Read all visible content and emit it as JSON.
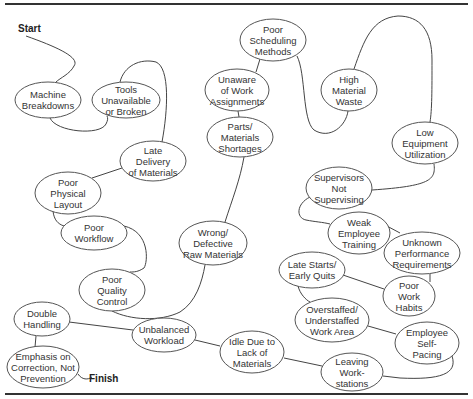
{
  "diagram": {
    "type": "spaghetti-flow",
    "start_label": "Start",
    "finish_label": "Finish",
    "colors": {
      "line": "#444444",
      "ellipse_stroke": "#555555",
      "text": "#333333",
      "rule": "#333333"
    },
    "nodes": [
      {
        "id": "machine-breakdowns",
        "lines": [
          "Machine",
          "Breakdowns"
        ],
        "cx": 48,
        "cy": 100,
        "rx": 33,
        "ry": 18
      },
      {
        "id": "tools-unavailable",
        "lines": [
          "Tools",
          "Unavailable",
          "or Broken"
        ],
        "cx": 126,
        "cy": 100,
        "rx": 34,
        "ry": 18
      },
      {
        "id": "late-delivery",
        "lines": [
          "Late",
          "Delivery",
          "of Materials"
        ],
        "cx": 153,
        "cy": 161,
        "rx": 33,
        "ry": 20
      },
      {
        "id": "poor-physical-layout",
        "lines": [
          "Poor",
          "Physical",
          "Layout"
        ],
        "cx": 68,
        "cy": 193,
        "rx": 33,
        "ry": 21
      },
      {
        "id": "poor-workflow",
        "lines": [
          "Poor",
          "Workflow"
        ],
        "cx": 94,
        "cy": 233,
        "rx": 33,
        "ry": 17
      },
      {
        "id": "poor-quality-control",
        "lines": [
          "Poor",
          "Quality",
          "Control"
        ],
        "cx": 112,
        "cy": 290,
        "rx": 33,
        "ry": 21
      },
      {
        "id": "wrong-defective-raw-materials",
        "lines": [
          "Wrong/",
          "Defective",
          "Raw Materials"
        ],
        "cx": 213,
        "cy": 243,
        "rx": 34,
        "ry": 22
      },
      {
        "id": "parts-materials-shortages",
        "lines": [
          "Parts/",
          "Materials",
          "Shortages"
        ],
        "cx": 240,
        "cy": 137,
        "rx": 33,
        "ry": 20
      },
      {
        "id": "unaware-of-work-assignments",
        "lines": [
          "Unaware",
          "of Work",
          "Assignments"
        ],
        "cx": 237,
        "cy": 90,
        "rx": 32,
        "ry": 21
      },
      {
        "id": "poor-scheduling-methods",
        "lines": [
          "Poor",
          "Scheduling",
          "Methods"
        ],
        "cx": 273,
        "cy": 40,
        "rx": 33,
        "ry": 21
      },
      {
        "id": "high-material-waste",
        "lines": [
          "High",
          "Material",
          "Waste"
        ],
        "cx": 349,
        "cy": 90,
        "rx": 28,
        "ry": 21
      },
      {
        "id": "low-equipment-utilization",
        "lines": [
          "Low",
          "Equipment",
          "Utilization"
        ],
        "cx": 425,
        "cy": 143,
        "rx": 33,
        "ry": 21
      },
      {
        "id": "supervisors-not-supervising",
        "lines": [
          "Supervisors",
          "Not",
          "Supervising"
        ],
        "cx": 339,
        "cy": 188,
        "rx": 33,
        "ry": 21
      },
      {
        "id": "weak-employee-training",
        "lines": [
          "Weak",
          "Employee",
          "Training"
        ],
        "cx": 359,
        "cy": 233,
        "rx": 31,
        "ry": 21
      },
      {
        "id": "unknown-performance-requirements",
        "lines": [
          "Unknown",
          "Performance",
          "Requirements"
        ],
        "cx": 422,
        "cy": 253,
        "rx": 38,
        "ry": 21
      },
      {
        "id": "late-starts-early-quits",
        "lines": [
          "Late Starts/",
          "Early Quits"
        ],
        "cx": 312,
        "cy": 270,
        "rx": 33,
        "ry": 18
      },
      {
        "id": "poor-work-habits",
        "lines": [
          "Poor",
          "Work",
          "Habits"
        ],
        "cx": 409,
        "cy": 296,
        "rx": 26,
        "ry": 20
      },
      {
        "id": "overstaffed-understaffed",
        "lines": [
          "Overstaffed/",
          "Understaffed",
          "Work Area"
        ],
        "cx": 332,
        "cy": 320,
        "rx": 37,
        "ry": 22
      },
      {
        "id": "employee-self-pacing",
        "lines": [
          "Employee",
          "Self-",
          "Pacing"
        ],
        "cx": 427,
        "cy": 343,
        "rx": 32,
        "ry": 21
      },
      {
        "id": "leaving-workstations",
        "lines": [
          "Leaving",
          "Work-",
          "stations"
        ],
        "cx": 352,
        "cy": 372,
        "rx": 31,
        "ry": 19
      },
      {
        "id": "idle-due-to-lack-of-materials",
        "lines": [
          "Idle Due to",
          "Lack of",
          "Materials"
        ],
        "cx": 252,
        "cy": 352,
        "rx": 32,
        "ry": 21
      },
      {
        "id": "unbalanced-workload",
        "lines": [
          "Unbalanced",
          "Workload"
        ],
        "cx": 164,
        "cy": 335,
        "rx": 32,
        "ry": 17
      },
      {
        "id": "double-handling",
        "lines": [
          "Double",
          "Handling"
        ],
        "cx": 42,
        "cy": 319,
        "rx": 28,
        "ry": 17
      },
      {
        "id": "emphasis-on-correction",
        "lines": [
          "Emphasis on",
          "Correction, Not",
          "Prevention"
        ],
        "cx": 43,
        "cy": 367,
        "rx": 36,
        "ry": 21
      }
    ],
    "connectors": [
      {
        "id": "start-to-machine",
        "d": "M26 36 C 60 48, 80 58, 74 66 C 70 74, 60 78, 56 82"
      },
      {
        "id": "machine-to-tools",
        "d": "M50 118 C 56 132, 100 136, 106 124 C 108 120, 108 118, 107 116"
      },
      {
        "id": "tools-to-late-delivery",
        "d": "M120 82 C 124 66, 140 58, 156 62 C 170 68, 168 110, 162 142"
      },
      {
        "id": "late-delivery-to-layout",
        "d": "M122 168 L 92 178"
      },
      {
        "id": "layout-to-workflow",
        "d": "M53 211 C 54 220, 58 224, 64 226"
      },
      {
        "id": "workflow-to-quality",
        "d": "M124 226 C 150 232, 148 262, 144 268 C 138 272, 134 272, 130 272"
      },
      {
        "id": "quality-to-wrong",
        "d": "M112 311 C 130 320, 160 322, 180 312 C 196 302, 202 282, 205 265"
      },
      {
        "id": "wrong-to-parts",
        "d": "M225 222 C 232 200, 240 180, 244 157"
      },
      {
        "id": "parts-to-unaware",
        "d": "M239 117 L 238 111"
      },
      {
        "id": "unaware-to-scheduling",
        "d": "M256 72 L 260 59"
      },
      {
        "id": "scheduling-to-high-waste",
        "d": "M297 56 C 306 74, 302 120, 314 130 C 330 140, 346 126, 348 111"
      },
      {
        "id": "high-waste-to-low-util",
        "d": "M354 69 C 364 40, 372 18, 398 16 C 420 16, 432 30, 432 60 C 432 90, 432 110, 430 122"
      },
      {
        "id": "low-util-to-supervisors",
        "d": "M434 164 C 436 180, 430 186, 372 190"
      },
      {
        "id": "supervisors-to-training",
        "d": "M310 197 C 296 204, 296 218, 306 220 C 316 222, 322 222, 330 224"
      },
      {
        "id": "training-to-unknown",
        "d": "M385 225 L 400 233"
      },
      {
        "id": "unknown-to-work-habits",
        "d": "M430 274 L 430 282"
      },
      {
        "id": "work-habits-to-late-starts",
        "d": "M384 289 L 340 274"
      },
      {
        "id": "late-starts-to-overstaffed",
        "d": "M298 286 C 300 294, 306 300, 310 302"
      },
      {
        "id": "overstaffed-to-self-pacing",
        "d": "M368 326 L 396 334"
      },
      {
        "id": "self-pacing-to-leaving",
        "d": "M452 356 C 458 374, 440 380, 400 378 L 383 376"
      },
      {
        "id": "leaving-to-idle",
        "d": "M322 366 L 284 358"
      },
      {
        "id": "idle-to-unbalanced",
        "d": "M220 346 L 195 340"
      },
      {
        "id": "unbalanced-to-double",
        "d": "M133 330 L 69 322"
      },
      {
        "id": "double-to-emphasis",
        "d": "M36 336 L 35 347"
      },
      {
        "id": "emphasis-to-finish",
        "d": "M78 374 C 82 380, 88 380, 92 377"
      }
    ]
  }
}
